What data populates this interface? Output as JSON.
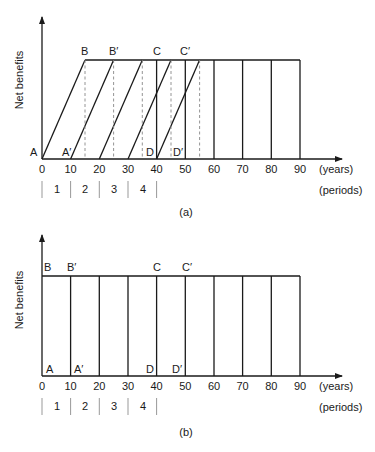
{
  "figure": {
    "panels": [
      {
        "id": "a",
        "caption": "(a)",
        "y_axis_label": "Net benefits",
        "x_axis_unit": "(years)",
        "period_unit": "(periods)",
        "x_ticks": [
          "0",
          "10",
          "20",
          "30",
          "40",
          "50",
          "60",
          "70",
          "80",
          "90"
        ],
        "periods": [
          "1",
          "2",
          "3",
          "4"
        ],
        "point_labels": {
          "A": "A",
          "A_prime": "A′",
          "B": "B",
          "B_prime": "B′",
          "C": "C",
          "C_prime": "C′",
          "D": "D",
          "D_prime": "D′"
        },
        "description": "Benefits ramp linearly over 15 years from each start (0,10,20,30,40) then plateau; dashed lines mark end of ramp (15,25,35,45,55)"
      },
      {
        "id": "b",
        "caption": "(b)",
        "y_axis_label": "Net benefits",
        "x_axis_unit": "(years)",
        "period_unit": "(periods)",
        "x_ticks": [
          "0",
          "10",
          "20",
          "30",
          "40",
          "50",
          "60",
          "70",
          "80",
          "90"
        ],
        "periods": [
          "1",
          "2",
          "3",
          "4"
        ],
        "point_labels": {
          "A": "A",
          "A_prime": "A′",
          "B": "B",
          "B_prime": "B′",
          "C": "C",
          "C_prime": "C′",
          "D": "D",
          "D_prime": "D′"
        },
        "description": "Benefits reach full level immediately at each start year; rectangular blocks at 10-year intervals"
      }
    ],
    "colors": {
      "ink": "#1a1a1a",
      "dashed": "#888888",
      "separator": "#999999"
    }
  }
}
